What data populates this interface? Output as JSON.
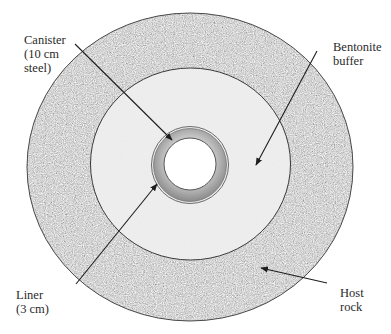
{
  "figure": {
    "colors": {
      "background": "#ffffff",
      "host_rock_base": "#b9b9b9",
      "host_rock_outline": "#4a4a4a",
      "buffer_fill": "#ebebeb",
      "buffer_outline": "#3a3a3a",
      "liner_ring": "#9a9a9a",
      "canister_hole": "#ffffff",
      "leader_line": "#1e1e1e"
    },
    "labels": {
      "canister": {
        "line1": "Canister",
        "line2": "(10 cm",
        "line3": "steel)"
      },
      "bentonite": {
        "line1": "Bentonite",
        "line2": "buffer"
      },
      "liner": {
        "line1": "Liner",
        "line2": "(3 cm)"
      },
      "host_rock": {
        "line1": "Host",
        "line2": "rock"
      }
    },
    "geometry": {
      "center": [
        190,
        166
      ],
      "host_rock_radii": [
        163,
        154
      ],
      "buffer_radii": [
        100,
        96
      ],
      "canister_outer_radius": 38,
      "canister_inner_radius": 26
    }
  }
}
